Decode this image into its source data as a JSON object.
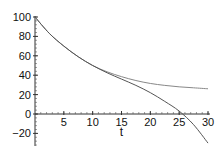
{
  "chart_data": {
    "type": "line",
    "title": "",
    "xlabel": "t",
    "ylabel": "",
    "xlim": [
      0,
      30
    ],
    "ylim": [
      -33,
      100
    ],
    "grid": false,
    "legend": null,
    "x_ticks": [
      5,
      10,
      15,
      20,
      25,
      30
    ],
    "y_ticks": [
      -20,
      0,
      20,
      40,
      60,
      80,
      100
    ],
    "x_tick_labels": [
      "5",
      "10",
      "15",
      "20",
      "25",
      "30"
    ],
    "y_tick_labels": [
      "-20",
      "0",
      "20",
      "40",
      "60",
      "80",
      "100"
    ],
    "x": [
      0,
      2.5,
      5,
      7.5,
      10,
      12.5,
      15,
      17.5,
      20,
      22.5,
      25,
      27.5,
      30
    ],
    "series": [
      {
        "name": "upper curve",
        "color": "#888888",
        "values": [
          100,
          83,
          70,
          59,
          50,
          43.5,
          38.5,
          34.5,
          31.5,
          29.5,
          28,
          27,
          26
        ]
      },
      {
        "name": "lower curve",
        "color": "#555555",
        "values": [
          100,
          83,
          70,
          59,
          50,
          42.5,
          36,
          29.5,
          22,
          13,
          3,
          -11,
          -30
        ]
      }
    ]
  }
}
